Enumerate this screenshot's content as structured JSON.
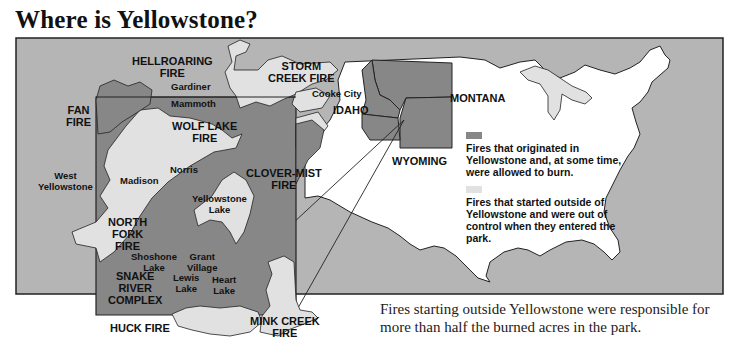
{
  "title": "Where is Yellowstone?",
  "colors": {
    "background_land": "#b5b5b5",
    "origin_fires": "#878787",
    "outside_fires": "#e1e1e1",
    "us_land": "#ffffff",
    "outline": "#222222"
  },
  "fire_labels": {
    "hellroaring": "HELLROARING\nFIRE",
    "storm_creek": "STORM\nCREEK FIRE",
    "fan": "FAN\nFIRE",
    "wolf_lake": "WOLF LAKE\nFIRE",
    "clover_mist": "CLOVER-MIST\nFIRE",
    "north_fork": "NORTH\nFORK\nFIRE",
    "snake_river": "SNAKE\nRIVER\nCOMPLEX",
    "huck": "HUCK FIRE",
    "mink_creek": "MINK CREEK\nFIRE"
  },
  "place_labels": {
    "gardiner": "Gardiner",
    "mammoth": "Mammoth",
    "cooke_city": "Cooke City",
    "west_yellowstone": "West\nYellowstone",
    "madison": "Madison",
    "norris": "Norris",
    "yellowstone_lake": "Yellowstone\nLake",
    "shoshone_lake": "Shoshone\nLake",
    "grant_village": "Grant\nVillage",
    "lewis_lake": "Lewis\nLake",
    "heart_lake": "Heart\nLake"
  },
  "state_labels": {
    "idaho": "IDAHO",
    "montana": "MONTANA",
    "wyoming": "WYOMING"
  },
  "legend": {
    "items": [
      {
        "swatch": "dark-gray",
        "text": "Fires that originated in Yellowstone and, at some time, were allowed to burn."
      },
      {
        "swatch": "light-gray",
        "text": "Fires that started outside of Yellowstone and were out of control when they entered the park."
      }
    ]
  },
  "caption": "Fires starting outside Yellowstone were responsible for more than half the burned acres in the park."
}
